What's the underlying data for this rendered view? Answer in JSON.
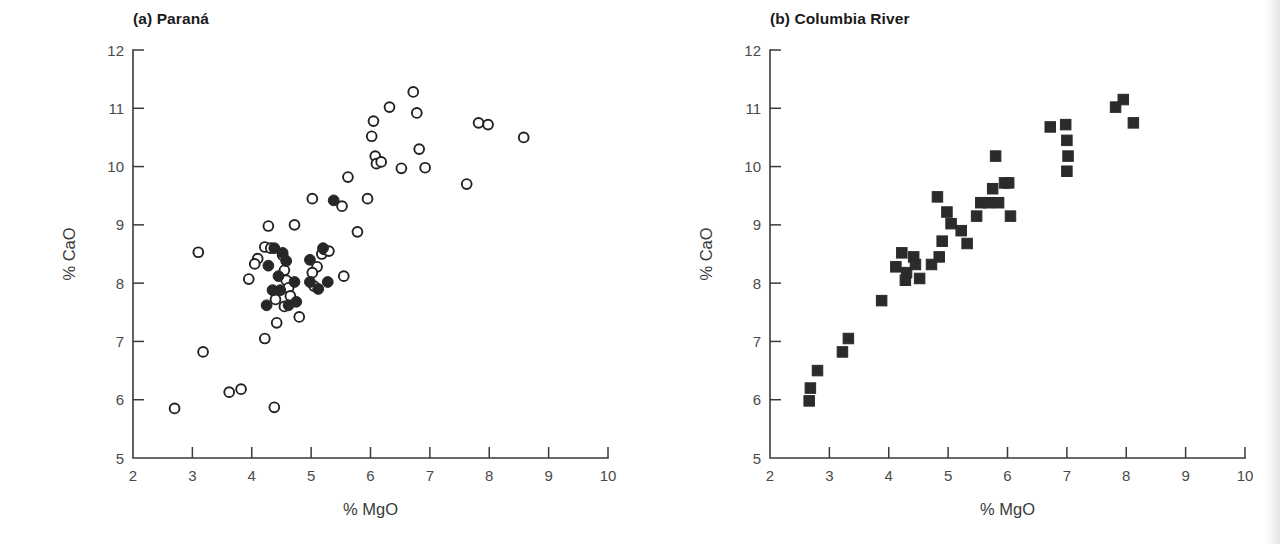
{
  "figure": {
    "background_color": "#ffffff",
    "ink_color": "#231f20",
    "width": 1280,
    "height": 544
  },
  "chart_data": [
    {
      "type": "scatter",
      "panel_id": "a",
      "title": "(a) Paraná",
      "xlabel": "% MgO",
      "ylabel": "% CaO",
      "xlim": [
        2,
        10
      ],
      "ylim": [
        5,
        12
      ],
      "xticks": [
        2,
        3,
        4,
        5,
        6,
        7,
        8,
        9,
        10
      ],
      "yticks": [
        5,
        6,
        7,
        8,
        9,
        10,
        11,
        12
      ],
      "grid": false,
      "legend": "none",
      "tick_direction": "inward",
      "series": [
        {
          "name": "open-circles",
          "marker": "open-circle",
          "marker_color": "#ffffff",
          "marker_edge_color": "#222222",
          "points": [
            [
              2.7,
              5.85
            ],
            [
              3.1,
              8.53
            ],
            [
              3.18,
              6.82
            ],
            [
              3.62,
              6.13
            ],
            [
              3.82,
              6.18
            ],
            [
              3.95,
              8.07
            ],
            [
              4.22,
              7.05
            ],
            [
              4.38,
              5.87
            ],
            [
              4.22,
              8.62
            ],
            [
              4.32,
              8.6
            ],
            [
              4.1,
              8.42
            ],
            [
              4.05,
              8.33
            ],
            [
              4.52,
              8.48
            ],
            [
              4.55,
              8.22
            ],
            [
              4.58,
              8.05
            ],
            [
              4.62,
              7.92
            ],
            [
              4.65,
              7.78
            ],
            [
              4.55,
              7.6
            ],
            [
              4.4,
              7.72
            ],
            [
              4.42,
              7.32
            ],
            [
              4.8,
              7.42
            ],
            [
              4.28,
              8.98
            ],
            [
              4.72,
              9.0
            ],
            [
              5.02,
              9.45
            ],
            [
              5.1,
              8.28
            ],
            [
              5.02,
              8.18
            ],
            [
              5.18,
              8.5
            ],
            [
              5.22,
              8.58
            ],
            [
              5.3,
              8.55
            ],
            [
              5.05,
              7.95
            ],
            [
              5.52,
              9.32
            ],
            [
              5.55,
              8.12
            ],
            [
              5.62,
              9.82
            ],
            [
              5.78,
              8.88
            ],
            [
              5.95,
              9.45
            ],
            [
              6.02,
              10.52
            ],
            [
              6.08,
              10.18
            ],
            [
              6.1,
              10.05
            ],
            [
              6.18,
              10.08
            ],
            [
              6.05,
              10.78
            ],
            [
              6.32,
              11.02
            ],
            [
              6.52,
              9.97
            ],
            [
              6.72,
              11.28
            ],
            [
              6.78,
              10.92
            ],
            [
              6.82,
              10.3
            ],
            [
              6.92,
              9.98
            ],
            [
              7.62,
              9.7
            ],
            [
              7.82,
              10.75
            ],
            [
              7.98,
              10.72
            ],
            [
              8.58,
              10.5
            ]
          ]
        },
        {
          "name": "filled-circles",
          "marker": "filled-circle",
          "marker_color": "#272727",
          "points": [
            [
              4.38,
              8.6
            ],
            [
              4.52,
              8.52
            ],
            [
              4.58,
              8.38
            ],
            [
              4.28,
              8.3
            ],
            [
              4.45,
              8.12
            ],
            [
              4.72,
              8.02
            ],
            [
              4.48,
              7.88
            ],
            [
              4.75,
              7.68
            ],
            [
              4.62,
              7.62
            ],
            [
              4.35,
              7.88
            ],
            [
              4.25,
              7.62
            ],
            [
              4.98,
              8.4
            ],
            [
              4.98,
              8.02
            ],
            [
              5.2,
              8.6
            ],
            [
              5.28,
              8.02
            ],
            [
              5.38,
              9.42
            ],
            [
              5.12,
              7.9
            ]
          ]
        }
      ]
    },
    {
      "type": "scatter",
      "panel_id": "b",
      "title": "(b) Columbia River",
      "xlabel": "% MgO",
      "ylabel": "% CaO",
      "xlim": [
        2,
        10
      ],
      "ylim": [
        5,
        12
      ],
      "xticks": [
        2,
        3,
        4,
        5,
        6,
        7,
        8,
        9,
        10
      ],
      "yticks": [
        5,
        6,
        7,
        8,
        9,
        10,
        11,
        12
      ],
      "grid": false,
      "legend": "none",
      "tick_direction": "inward",
      "series": [
        {
          "name": "filled-squares",
          "marker": "filled-square",
          "marker_color": "#2b2b2b",
          "points": [
            [
              2.66,
              5.98
            ],
            [
              2.68,
              6.2
            ],
            [
              2.8,
              6.5
            ],
            [
              3.22,
              6.82
            ],
            [
              3.32,
              7.05
            ],
            [
              3.88,
              7.7
            ],
            [
              4.12,
              8.28
            ],
            [
              4.28,
              8.05
            ],
            [
              4.3,
              8.18
            ],
            [
              4.22,
              8.52
            ],
            [
              4.42,
              8.45
            ],
            [
              4.45,
              8.32
            ],
            [
              4.52,
              8.08
            ],
            [
              4.72,
              8.32
            ],
            [
              4.85,
              8.45
            ],
            [
              4.9,
              8.72
            ],
            [
              4.82,
              9.48
            ],
            [
              4.98,
              9.22
            ],
            [
              5.05,
              9.02
            ],
            [
              5.22,
              8.9
            ],
            [
              5.32,
              8.68
            ],
            [
              5.48,
              9.15
            ],
            [
              5.55,
              9.38
            ],
            [
              5.68,
              9.38
            ],
            [
              5.75,
              9.62
            ],
            [
              5.8,
              10.18
            ],
            [
              5.85,
              9.38
            ],
            [
              5.95,
              9.72
            ],
            [
              6.02,
              9.72
            ],
            [
              6.05,
              9.15
            ],
            [
              6.72,
              10.68
            ],
            [
              6.98,
              10.72
            ],
            [
              7.0,
              10.45
            ],
            [
              7.02,
              10.18
            ],
            [
              7.0,
              9.92
            ],
            [
              7.82,
              11.02
            ],
            [
              7.95,
              11.15
            ],
            [
              8.12,
              10.75
            ]
          ]
        }
      ]
    }
  ]
}
